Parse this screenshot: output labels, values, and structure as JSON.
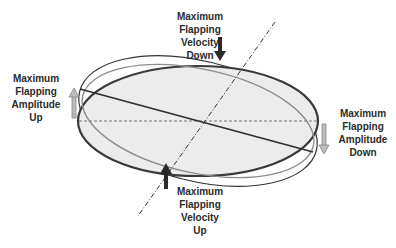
{
  "diagram": {
    "labels": {
      "velocity_down": [
        "Maximum",
        "Flapping",
        "Velocity",
        "Down"
      ],
      "amplitude_up": [
        "Maximum",
        "Flapping",
        "Amplitude",
        "Up"
      ],
      "amplitude_down": [
        "Maximum",
        "Flapping",
        "Amplitude",
        "Down"
      ],
      "velocity_up": [
        "Maximum",
        "Flapping",
        "Velocity",
        "Up"
      ]
    },
    "colors": {
      "disc_fill": "#ececec",
      "disc_outline": "#3a3a3a",
      "tilted_outline": "#333333",
      "gray_outline": "#8c8c8c",
      "dark_arrow": "#2a2a2a",
      "hollow_arrow_fill": "#bdbdbd",
      "hollow_arrow_stroke": "#7a7a7a",
      "text": "#2b2b2b"
    }
  }
}
